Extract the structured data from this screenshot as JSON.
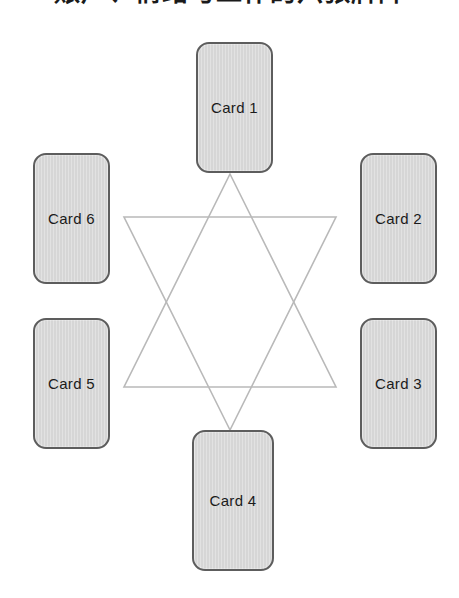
{
  "page": {
    "title": "账户、情绪与工作的六张牌阵",
    "title_note": "clipped-cjk-heading",
    "background_color": "#ffffff"
  },
  "spread": {
    "shape_name": "hexagram",
    "star_color": "#b9b9b9",
    "card_fill_color": "#d6d6d6",
    "card_border_color": "#5d5d5d",
    "label_color": "#1b1b1b",
    "cards": [
      {
        "id": "card-1",
        "label": "Card 1",
        "position": "top"
      },
      {
        "id": "card-2",
        "label": "Card 2",
        "position": "upper-right"
      },
      {
        "id": "card-3",
        "label": "Card 3",
        "position": "lower-right"
      },
      {
        "id": "card-4",
        "label": "Card 4",
        "position": "bottom"
      },
      {
        "id": "card-5",
        "label": "Card 5",
        "position": "lower-left"
      },
      {
        "id": "card-6",
        "label": "Card 6",
        "position": "upper-left"
      }
    ]
  }
}
